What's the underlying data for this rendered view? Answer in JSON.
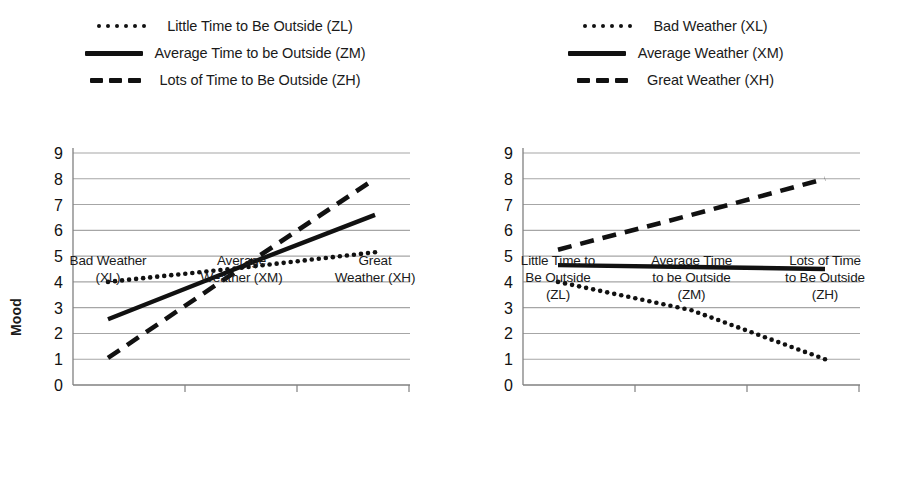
{
  "figure": {
    "background": "#ffffff",
    "line_color": "#111111",
    "grid_color": "#a6a6a6",
    "axis_color": "#808080"
  },
  "charts": [
    {
      "id": "left",
      "ylabel": "Mood",
      "yticks": [
        "9",
        "8",
        "7",
        "6",
        "5",
        "4",
        "3",
        "2",
        "1",
        "0"
      ],
      "legend": [
        {
          "style": "dotted",
          "label": "Little Time to Be Outside (ZL)"
        },
        {
          "style": "solid",
          "label": "Average Time to be Outside (ZM)"
        },
        {
          "style": "dashed",
          "label": "Lots of Time to Be Outside (ZH)"
        }
      ],
      "xcats": [
        [
          "Bad Weather",
          "(XL)"
        ],
        [
          "Average",
          "Weather (XM)"
        ],
        [
          "Great",
          "Weather (XH)"
        ]
      ]
    },
    {
      "id": "right",
      "ylabel": "Mood",
      "yticks": [
        "9",
        "8",
        "7",
        "6",
        "5",
        "4",
        "3",
        "2",
        "1",
        "0"
      ],
      "legend": [
        {
          "style": "dotted",
          "label": "Bad Weather (XL)"
        },
        {
          "style": "solid",
          "label": "Average Weather (XM)"
        },
        {
          "style": "dashed",
          "label": "Great Weather (XH)"
        }
      ],
      "xcats": [
        [
          "Little Time to",
          "Be Outside",
          "(ZL)"
        ],
        [
          "Average Time",
          "to be Outside",
          "(ZM)"
        ],
        [
          "Lots of Time",
          "to Be Outside",
          "(ZH)"
        ]
      ]
    }
  ],
  "chart_data": [
    {
      "type": "line",
      "title": "",
      "xlabel": "",
      "ylabel": "Mood",
      "categories": [
        "Bad Weather (XL)",
        "Average Weather (XM)",
        "Great Weather (XH)"
      ],
      "ylim": [
        0,
        9
      ],
      "yticks": [
        0,
        1,
        2,
        3,
        4,
        5,
        6,
        7,
        8,
        9
      ],
      "grid": true,
      "legend_position": "top",
      "series": [
        {
          "name": "Little Time to Be Outside (ZL)",
          "style": "dotted",
          "values": [
            4.0,
            4.55,
            5.15
          ]
        },
        {
          "name": "Average Time to be Outside (ZM)",
          "style": "solid",
          "values": [
            2.55,
            4.6,
            6.6
          ]
        },
        {
          "name": "Lots of Time to Be Outside (ZH)",
          "style": "dashed",
          "values": [
            1.05,
            4.55,
            8.0
          ]
        }
      ]
    },
    {
      "type": "line",
      "title": "",
      "xlabel": "",
      "ylabel": "Mood",
      "categories": [
        "Little Time to Be Outside (ZL)",
        "Average Time to be Outside (ZM)",
        "Lots of Time to Be Outside (ZH)"
      ],
      "ylim": [
        0,
        9
      ],
      "yticks": [
        0,
        1,
        2,
        3,
        4,
        5,
        6,
        7,
        8,
        9
      ],
      "grid": true,
      "legend_position": "top",
      "series": [
        {
          "name": "Bad Weather (XL)",
          "style": "dotted",
          "values": [
            4.0,
            2.9,
            1.0
          ]
        },
        {
          "name": "Average Weather (XM)",
          "style": "solid",
          "values": [
            4.65,
            4.58,
            4.5
          ]
        },
        {
          "name": "Great Weather (XH)",
          "style": "dashed",
          "values": [
            5.25,
            6.6,
            8.0
          ]
        }
      ]
    }
  ]
}
